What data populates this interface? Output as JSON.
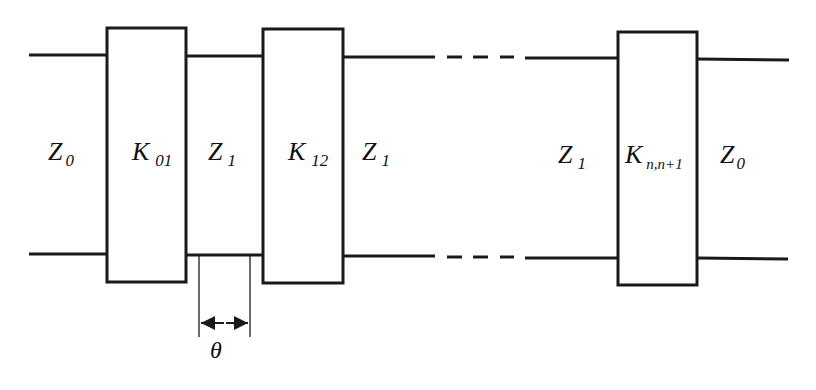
{
  "diagram": {
    "colors": {
      "stroke": "#1a1a1a",
      "background": "#ffffff"
    },
    "labels": {
      "z0_left": {
        "main": "Z",
        "sub": "0"
      },
      "k01": {
        "main": "K",
        "sub": "01"
      },
      "z1_a": {
        "main": "Z",
        "sub": "1"
      },
      "k12": {
        "main": "K",
        "sub": "12"
      },
      "z1_b": {
        "main": "Z",
        "sub": "1"
      },
      "z1_c": {
        "main": "Z",
        "sub": "1"
      },
      "kn": {
        "main": "K",
        "sub": "n,n+1"
      },
      "z0_right": {
        "main": "Z",
        "sub": "0"
      },
      "theta": "θ"
    },
    "blocks": [
      {
        "id": "k01",
        "x": 107,
        "y": 28,
        "w": 79,
        "h": 254
      },
      {
        "id": "k12",
        "x": 263,
        "y": 29,
        "w": 80,
        "h": 254
      },
      {
        "id": "kn",
        "x": 618,
        "y": 32,
        "w": 79,
        "h": 253
      }
    ]
  }
}
